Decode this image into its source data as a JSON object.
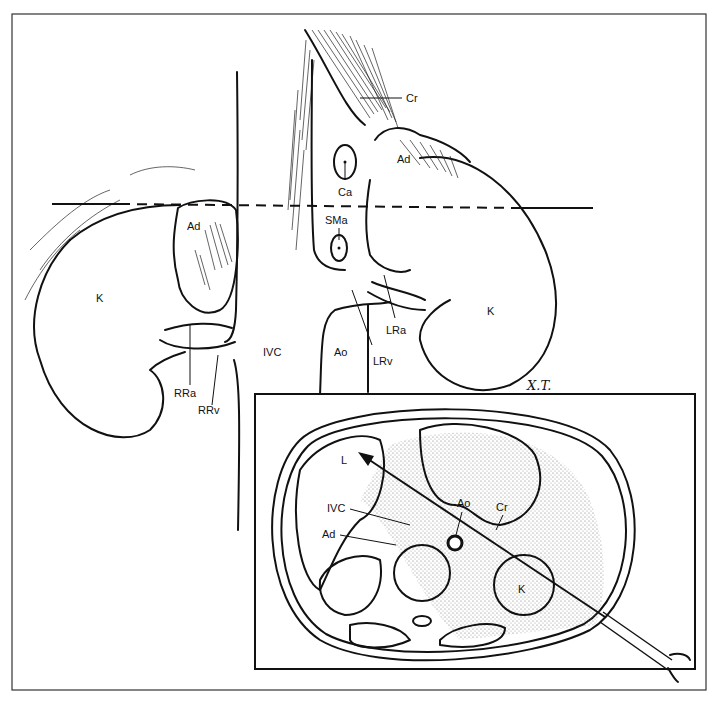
{
  "figure": {
    "kind": "anatomical illustration",
    "signature": "X.T.",
    "colors": {
      "ink": "#111111",
      "paper": "#ffffff",
      "stipple": "#555555"
    }
  },
  "main_view": {
    "labels": {
      "cr": "Cr",
      "ca": "Ca",
      "sma": "SMa",
      "ad_left": "Ad",
      "ad_right": "Ad",
      "k_left": "K",
      "k_right": "K",
      "ivc": "IVC",
      "ao": "Ao",
      "lrv": "LRv",
      "lra": "LRa",
      "rra": "RRa",
      "rrv": "RRv"
    }
  },
  "inset": {
    "labels": {
      "l": "L",
      "ivc": "IVC",
      "ad": "Ad",
      "ao": "Ao",
      "cr": "Cr",
      "k": "K"
    }
  }
}
